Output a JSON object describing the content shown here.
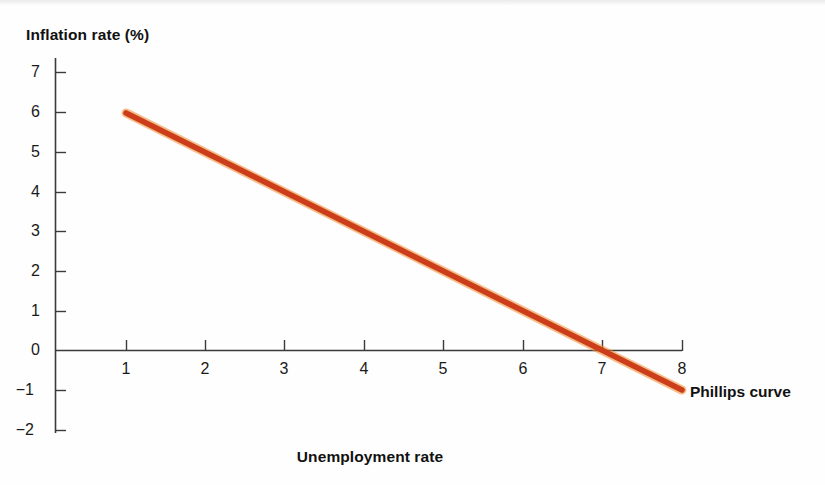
{
  "chart_data": {
    "type": "line",
    "title": "",
    "xlabel": "Unemployment rate",
    "ylabel": "Inflation rate (%)",
    "xlim": [
      0.45,
      8.35
    ],
    "ylim": [
      -2,
      7.4
    ],
    "grid": false,
    "legend_position": "inline-right-end",
    "xticks": [
      "1",
      "2",
      "3",
      "4",
      "5",
      "6",
      "7",
      "8"
    ],
    "xtick_values": [
      1,
      2,
      3,
      4,
      5,
      6,
      7,
      8
    ],
    "yticks": [
      "7",
      "6",
      "5",
      "4",
      "3",
      "2",
      "1",
      "0",
      "−1",
      "−2"
    ],
    "ytick_values": [
      7,
      6,
      5,
      4,
      3,
      2,
      1,
      0,
      -1,
      -2
    ],
    "series": [
      {
        "name": "Phillips curve",
        "color": "#cc3d19",
        "x": [
          1,
          8
        ],
        "values": [
          6,
          -1
        ],
        "slope": -1,
        "x_intercept": 7,
        "points": [
          {
            "x": 1,
            "y": 6
          },
          {
            "x": 2,
            "y": 5
          },
          {
            "x": 3,
            "y": 4
          },
          {
            "x": 4,
            "y": 3
          },
          {
            "x": 5,
            "y": 2
          },
          {
            "x": 6,
            "y": 1
          },
          {
            "x": 7,
            "y": 0
          },
          {
            "x": 8,
            "y": -1
          }
        ]
      }
    ],
    "annotations": [
      {
        "text": "Phillips curve",
        "x": 8.1,
        "y": -1.1
      }
    ]
  },
  "labels": {
    "y_axis_title": "Inflation rate (%)",
    "x_axis_title": "Unemployment rate",
    "curve_label": "Phillips curve"
  },
  "colors": {
    "curve": "#cc3d19",
    "curve_highlight": "#ee8a2e",
    "axis": "#3b3b3b",
    "text": "#111111",
    "background": "#fefefe"
  }
}
